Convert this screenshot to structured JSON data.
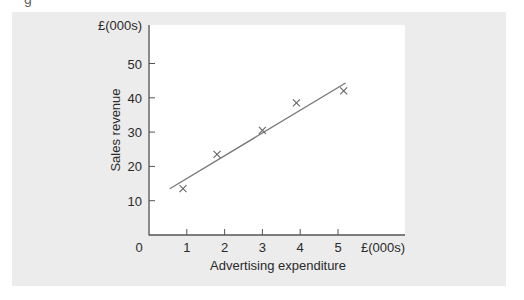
{
  "figure": {
    "panel_color": "#ececec",
    "plot_bg_color": "#ffffff",
    "axis_color": "#555555",
    "line_color": "#777777",
    "marker_color": "#666666"
  },
  "chart_data": {
    "type": "scatter",
    "title": "",
    "xlabel": "Advertising expenditure",
    "ylabel": "Sales revenue",
    "x_unit_label": "£(000s)",
    "y_unit_label": "£(000s)",
    "origin_label": "0",
    "xlim": [
      0,
      5.7
    ],
    "ylim": [
      0,
      56
    ],
    "xticks": [
      1,
      2,
      3,
      4,
      5
    ],
    "xtick_labels": [
      "1",
      "2",
      "3",
      "4",
      "5"
    ],
    "yticks": [
      10,
      20,
      30,
      40,
      50
    ],
    "ytick_labels": [
      "10",
      "20",
      "30",
      "40",
      "50"
    ],
    "grid": false,
    "legend": null,
    "series": [
      {
        "name": "Observations",
        "marker": "x",
        "points": [
          {
            "x": 0.9,
            "y": 13.5
          },
          {
            "x": 1.8,
            "y": 23.5
          },
          {
            "x": 3.0,
            "y": 30.5
          },
          {
            "x": 3.9,
            "y": 38.5
          },
          {
            "x": 5.15,
            "y": 42
          }
        ]
      },
      {
        "name": "Line of best fit",
        "type": "line",
        "points": [
          {
            "x": 0.55,
            "y": 13.5
          },
          {
            "x": 5.2,
            "y": 44.3
          }
        ]
      }
    ]
  }
}
